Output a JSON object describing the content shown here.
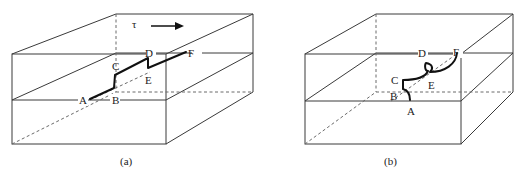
{
  "figure": {
    "panels": [
      {
        "id": "a",
        "caption": "(a)",
        "stress_symbol": "τ",
        "stress_direction": "right",
        "points": {
          "A": "A",
          "B": "B",
          "C": "C",
          "D": "D",
          "E": "E",
          "F": "F"
        },
        "description": "Straight dislocation line with jogs (BC and DE) on the slip plane of a crystal block"
      },
      {
        "id": "b",
        "caption": "(b)",
        "points": {
          "A": "A",
          "B": "B",
          "C": "C",
          "D": "D",
          "E": "E",
          "F": "F"
        },
        "description": "Curved dislocation line after motion, bowing around jogs"
      }
    ],
    "colors": {
      "line": "#3a3a3a",
      "dislocation": "#111111",
      "background": "#ffffff"
    }
  }
}
